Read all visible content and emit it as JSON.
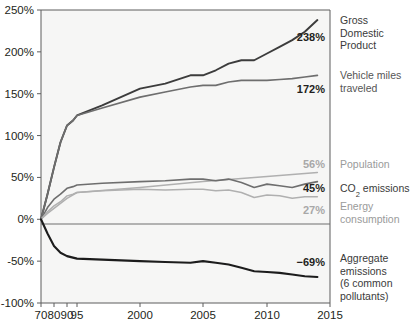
{
  "chart_data": {
    "type": "line",
    "title": "",
    "xlabel": "",
    "ylabel": "",
    "xlim": [
      1970,
      2015
    ],
    "ylim": [
      -100,
      250
    ],
    "grid": false,
    "legend_position": "right-inline",
    "y_ticks": [
      "250%",
      "200%",
      "150%",
      "100%",
      "50%",
      "0%",
      "-50%",
      "-100%"
    ],
    "y_tick_values": [
      250,
      200,
      150,
      100,
      50,
      0,
      -50,
      -100
    ],
    "x_ticks": [
      "70",
      "80",
      "90",
      "95",
      "2000",
      "2005",
      "2010",
      "2015"
    ],
    "x_tick_values": [
      1970,
      1980,
      1990,
      1995,
      2000,
      2005,
      2010,
      2015
    ],
    "series": [
      {
        "name": "Gross Domestic Product",
        "label_line1": "Gross",
        "label_line2": "Domestic",
        "label_line3": "Product",
        "end_value_label": "238%",
        "end_value": 238,
        "color": "#3c3c3c",
        "width": 1.9,
        "x": [
          1970,
          1975,
          1980,
          1985,
          1990,
          1993,
          1995,
          1997,
          2000,
          2002,
          2004,
          2005,
          2006,
          2007,
          2008,
          2009,
          2010,
          2011,
          2012,
          2013,
          2014
        ],
        "values": [
          0,
          30,
          62,
          92,
          112,
          118,
          124,
          136,
          156,
          162,
          172,
          172,
          178,
          186,
          190,
          190,
          198,
          206,
          214,
          224,
          238
        ]
      },
      {
        "name": "Vehicle miles traveled",
        "label_line1": "Vehicle miles",
        "label_line2": "traveled",
        "end_value_label": "172%",
        "end_value": 172,
        "color": "#6e6e6e",
        "width": 1.7,
        "x": [
          1970,
          1975,
          1980,
          1985,
          1990,
          1993,
          1995,
          1997,
          2000,
          2002,
          2004,
          2005,
          2006,
          2007,
          2008,
          2009,
          2010,
          2011,
          2012,
          2013,
          2014
        ],
        "values": [
          0,
          30,
          62,
          92,
          112,
          118,
          124,
          133,
          146,
          152,
          158,
          160,
          160,
          164,
          166,
          166,
          166,
          167,
          168,
          170,
          172
        ]
      },
      {
        "name": "Population",
        "label_line1": "Population",
        "end_value_label": "56%",
        "end_value": 56,
        "color": "#b0b0b0",
        "width": 1.5,
        "x": [
          1970,
          1975,
          1980,
          1985,
          1990,
          1995,
          2000,
          2005,
          2010,
          2014
        ],
        "values": [
          0,
          7,
          13,
          19,
          25,
          32,
          38,
          45,
          51,
          56
        ]
      },
      {
        "name": "CO2 emissions",
        "label_line1": "CO",
        "label_sub": "2",
        "label_line2": " emissions",
        "full_label": "CO₂ emissions",
        "end_value_label": "45%",
        "end_value": 45,
        "color": "#6e6e6e",
        "width": 1.6,
        "x": [
          1970,
          1975,
          1980,
          1985,
          1990,
          1993,
          1995,
          1997,
          2000,
          2002,
          2004,
          2005,
          2006,
          2007,
          2008,
          2009,
          2010,
          2011,
          2012,
          2013,
          2014
        ],
        "values": [
          0,
          14,
          24,
          30,
          37,
          39,
          41,
          43,
          45,
          46,
          48,
          48,
          46,
          48,
          44,
          38,
          42,
          40,
          38,
          42,
          45
        ]
      },
      {
        "name": "Energy consumption",
        "label_line1": "Energy",
        "label_line2": "consumption",
        "end_value_label": "27%",
        "end_value": 27,
        "color": "#b0b0b0",
        "width": 1.5,
        "x": [
          1970,
          1975,
          1980,
          1985,
          1990,
          1993,
          1995,
          1997,
          2000,
          2002,
          2004,
          2005,
          2006,
          2007,
          2008,
          2009,
          2010,
          2011,
          2012,
          2013,
          2014
        ],
        "values": [
          0,
          9,
          16,
          21,
          28,
          30,
          32,
          34,
          36,
          35,
          36,
          36,
          34,
          35,
          32,
          26,
          29,
          28,
          25,
          27,
          27
        ]
      },
      {
        "name": "Aggregate emissions (6 common pollutants)",
        "label_line1": "Aggregate",
        "label_line2": "emissions",
        "label_line3": "(6 common",
        "label_line4": "pollutants)",
        "end_value_label": "−69%",
        "end_value": -69,
        "color": "#1c1c1c",
        "width": 2.1,
        "x": [
          1970,
          1975,
          1980,
          1985,
          1990,
          1995,
          2000,
          2002,
          2004,
          2005,
          2006,
          2007,
          2008,
          2009,
          2010,
          2011,
          2012,
          2013,
          2014
        ],
        "values": [
          0,
          -17,
          -32,
          -40,
          -44,
          -47,
          -50,
          -51,
          -52,
          -50,
          -52,
          -54,
          -58,
          -62,
          -63,
          -64,
          -66,
          -68,
          -69
        ]
      }
    ]
  },
  "axis": {
    "y_unit": "%",
    "x_unit": "year"
  }
}
